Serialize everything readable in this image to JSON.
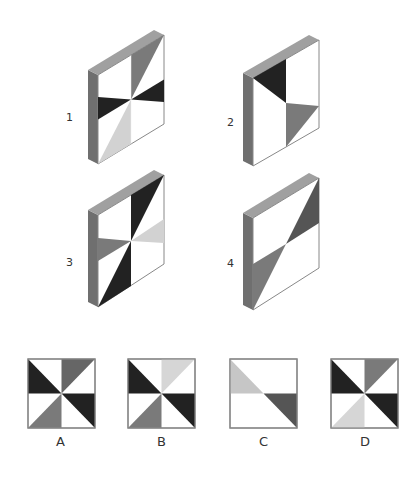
{
  "puzzle": {
    "description": "Spatial reasoning: four 3D panels showing front-face patterns; choose the flat square that matches",
    "colors": {
      "black": "#222222",
      "dark_gray": "#555555",
      "mid_gray": "#7a7a7a",
      "light_gray": "#cfcfcf",
      "white": "#ffffff",
      "edge_side": "#6a6a6a",
      "edge_top": "#9a9a9a",
      "outline": "#888888"
    },
    "panels": [
      {
        "label": "1"
      },
      {
        "label": "2"
      },
      {
        "label": "3"
      },
      {
        "label": "4"
      }
    ],
    "options": [
      {
        "label": "A"
      },
      {
        "label": "B"
      },
      {
        "label": "C"
      },
      {
        "label": "D"
      }
    ]
  }
}
